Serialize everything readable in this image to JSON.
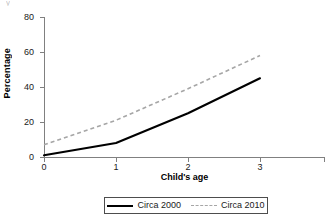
{
  "figure": {
    "clipped_top_artifact": "y"
  },
  "chart_data": {
    "type": "line",
    "title": "",
    "xlabel": "Child's age",
    "ylabel": "Percentage",
    "x": [
      0,
      1,
      2,
      3
    ],
    "xtick_labels": [
      "0",
      "1",
      "2",
      "3"
    ],
    "ytick_labels": [
      "0",
      "20",
      "40",
      "60",
      "80"
    ],
    "yticks": [
      0,
      20,
      40,
      60,
      80
    ],
    "xlim": [
      0,
      3.35
    ],
    "ylim": [
      0,
      80
    ],
    "grid": false,
    "legend_position": "bottom-center",
    "series": [
      {
        "name": "Circa 2000",
        "values": [
          1,
          8,
          25,
          45
        ],
        "style": "solid",
        "color": "#000000"
      },
      {
        "name": "Circa 2010",
        "values": [
          7,
          21,
          39,
          58
        ],
        "style": "dashed",
        "color": "#a6a6a6"
      }
    ]
  },
  "legend": {
    "entries": [
      {
        "label": "Circa 2000"
      },
      {
        "label": "Circa 2010"
      }
    ]
  },
  "axes": {
    "y_title": "Percentage",
    "x_title": "Child's age",
    "y_labels": [
      "80",
      "60",
      "40",
      "20",
      "0"
    ],
    "x_labels": [
      "0",
      "1",
      "2",
      "3"
    ]
  }
}
